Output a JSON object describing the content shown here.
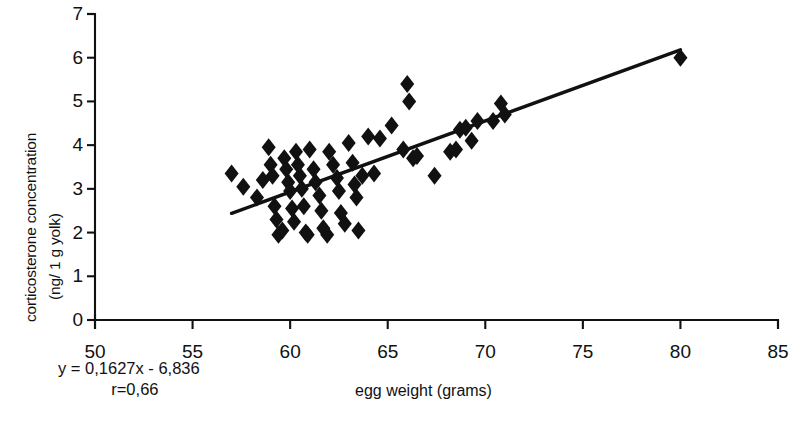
{
  "chart_data": {
    "type": "scatter",
    "title": "",
    "xlabel": "egg weight (grams)",
    "ylabel_line1": "corticosterone concentration",
    "ylabel_line2": "(ng/ 1 g yolk)",
    "xlim": [
      50,
      85
    ],
    "ylim": [
      0,
      7
    ],
    "xticks": [
      50,
      55,
      60,
      65,
      70,
      75,
      80,
      85
    ],
    "yticks": [
      0,
      1,
      2,
      3,
      4,
      5,
      6,
      7
    ],
    "grid": false,
    "legend": null,
    "annotations": {
      "equation": "y = 0,1627x - 6,836",
      "correlation": "r=0,66"
    },
    "trendline": {
      "slope": 0.1627,
      "intercept": -6.836,
      "x_start": 57.0,
      "x_end": 80.0,
      "y_start": 2.44,
      "y_end": 6.18
    },
    "marker": {
      "shape": "diamond",
      "color": "#111111",
      "size": 9
    },
    "points": [
      [
        57.0,
        3.35
      ],
      [
        57.6,
        3.05
      ],
      [
        58.3,
        2.8
      ],
      [
        58.6,
        3.2
      ],
      [
        58.9,
        3.95
      ],
      [
        59.0,
        3.55
      ],
      [
        59.1,
        3.3
      ],
      [
        59.2,
        2.6
      ],
      [
        59.3,
        2.3
      ],
      [
        59.4,
        1.95
      ],
      [
        59.6,
        2.05
      ],
      [
        59.7,
        3.7
      ],
      [
        59.8,
        3.45
      ],
      [
        59.9,
        3.15
      ],
      [
        60.0,
        2.95
      ],
      [
        60.1,
        2.55
      ],
      [
        60.2,
        2.25
      ],
      [
        60.3,
        3.85
      ],
      [
        60.4,
        3.55
      ],
      [
        60.5,
        3.3
      ],
      [
        60.6,
        3.0
      ],
      [
        60.7,
        2.6
      ],
      [
        60.8,
        2.0
      ],
      [
        60.9,
        1.95
      ],
      [
        61.0,
        3.9
      ],
      [
        61.2,
        3.45
      ],
      [
        61.3,
        3.15
      ],
      [
        61.5,
        2.85
      ],
      [
        61.6,
        2.5
      ],
      [
        61.7,
        2.1
      ],
      [
        61.9,
        1.95
      ],
      [
        62.0,
        3.85
      ],
      [
        62.2,
        3.55
      ],
      [
        62.4,
        3.25
      ],
      [
        62.5,
        2.95
      ],
      [
        62.6,
        2.45
      ],
      [
        62.8,
        2.2
      ],
      [
        63.0,
        4.05
      ],
      [
        63.2,
        3.6
      ],
      [
        63.3,
        3.1
      ],
      [
        63.4,
        2.8
      ],
      [
        63.5,
        2.05
      ],
      [
        63.7,
        3.3
      ],
      [
        64.0,
        4.2
      ],
      [
        64.3,
        3.35
      ],
      [
        64.6,
        4.15
      ],
      [
        65.2,
        4.45
      ],
      [
        65.8,
        3.9
      ],
      [
        66.0,
        5.4
      ],
      [
        66.1,
        5.0
      ],
      [
        66.3,
        3.7
      ],
      [
        66.5,
        3.75
      ],
      [
        67.4,
        3.3
      ],
      [
        68.2,
        3.85
      ],
      [
        68.5,
        3.9
      ],
      [
        68.7,
        4.35
      ],
      [
        69.0,
        4.4
      ],
      [
        69.3,
        4.1
      ],
      [
        69.6,
        4.55
      ],
      [
        70.4,
        4.55
      ],
      [
        70.8,
        4.95
      ],
      [
        71.0,
        4.7
      ],
      [
        80.0,
        6.0
      ]
    ]
  }
}
